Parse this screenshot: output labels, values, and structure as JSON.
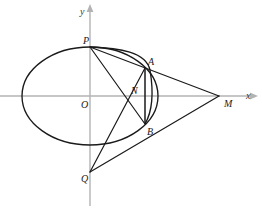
{
  "figure": {
    "background_color": "#ffffff",
    "stroke_color": "#1a1a1a",
    "axis_color": "#b3b3b3",
    "width": 262,
    "height": 211
  },
  "axes": {
    "x_label": "x",
    "y_label": "y",
    "origin_label": "O",
    "origin": {
      "x": 90,
      "y": 96
    },
    "x_axis": {
      "x1": 0,
      "y1": 96,
      "x2": 252,
      "y2": 96
    },
    "y_axis": {
      "x1": 90,
      "y1": 205,
      "x2": 90,
      "y2": 9
    }
  },
  "ellipse": {
    "center_x": 90,
    "center_y": 96,
    "semi_major": 68,
    "semi_minor": 49
  },
  "points": [
    {
      "name": "P",
      "label": "P",
      "x": 90,
      "y": 47,
      "label_x": 83,
      "label_y": 36
    },
    {
      "name": "A",
      "label": "A",
      "x": 145,
      "y": 68,
      "label_x": 148,
      "label_y": 57
    },
    {
      "name": "N",
      "label": "N",
      "x": 128,
      "y": 97,
      "label_x": 131,
      "label_y": 86
    },
    {
      "name": "B",
      "label": "B",
      "x": 145,
      "y": 124,
      "label_x": 147,
      "label_y": 127
    },
    {
      "name": "M",
      "label": "M",
      "x": 219,
      "y": 96,
      "label_x": 224,
      "label_y": 99
    },
    {
      "name": "Q",
      "label": "Q",
      "x": 90,
      "y": 172,
      "label_x": 81,
      "label_y": 174
    },
    {
      "name": "O",
      "label": "O",
      "x": 90,
      "y": 96,
      "label_x": 81,
      "label_y": 100
    }
  ],
  "segments": [
    {
      "name": "P-A-M",
      "from": "P",
      "to": "M",
      "x1": 90,
      "y1": 47,
      "x2": 219,
      "y2": 96
    },
    {
      "name": "P-N-B",
      "from": "P",
      "to": "B",
      "x1": 90,
      "y1": 47,
      "x2": 145,
      "y2": 124
    },
    {
      "name": "Q-N-A",
      "from": "Q",
      "to": "A",
      "x1": 90,
      "y1": 172,
      "x2": 145,
      "y2": 68
    },
    {
      "name": "Q-M",
      "from": "Q",
      "to": "M",
      "x1": 90,
      "y1": 172,
      "x2": 219,
      "y2": 96
    },
    {
      "name": "A-B",
      "from": "A",
      "to": "B",
      "x1": 145,
      "y1": 68,
      "x2": 145,
      "y2": 124
    }
  ],
  "arcs": [
    {
      "name": "arc-P-A-B",
      "description": "ellipse-like arc bulging right from P through A to B",
      "d": "M 90 47 Q 146 54 148 68 Q 152 100 145 124"
    }
  ]
}
